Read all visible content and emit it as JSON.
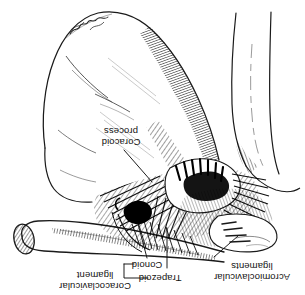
{
  "figure": {
    "orientation": "rotated-180",
    "style": "pen-and-ink stipple / hatch line art",
    "background_color": "#ffffff",
    "ink_color": "#000000"
  },
  "labels": {
    "coracoid_process": "Coracoid\nprocess",
    "coracoid_process_line1": "Coracoid",
    "coracoid_process_line2": "process",
    "coracoclavicular_ligament_line1": "Coracoclavicular",
    "coracoclavicular_ligament_line2": "ligament",
    "conoid": "Conoid",
    "trapezoid": "Trapezoid",
    "acromioclavicular_line1": "Acromioclavicular",
    "acromioclavicular_line2": "ligaments"
  },
  "structures": {
    "scapula_body": "scapula blade",
    "humerus_shaft": "humerus",
    "clavicle": "clavicle with cut cross-hatched end",
    "acromion": "acromion",
    "ligament_mass": "coracoclavicular and acromioclavicular ligament fibers"
  },
  "signature": {
    "present": true,
    "name": "artist signature"
  }
}
